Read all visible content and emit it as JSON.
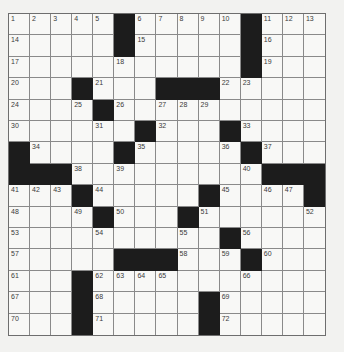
{
  "puzzle": {
    "rows": 15,
    "cols": 15,
    "colors": {
      "paper": "#f2f2f0",
      "cell": "#f8f8f6",
      "black": "#1c1c1c",
      "grid_line": "#8a8a8a",
      "number_text": "#3a3a3a"
    },
    "black_cells": [
      [
        0,
        5
      ],
      [
        0,
        11
      ],
      [
        1,
        5
      ],
      [
        1,
        11
      ],
      [
        2,
        11
      ],
      [
        3,
        3
      ],
      [
        3,
        7
      ],
      [
        3,
        8
      ],
      [
        3,
        9
      ],
      [
        4,
        4
      ],
      [
        5,
        6
      ],
      [
        5,
        10
      ],
      [
        6,
        0
      ],
      [
        6,
        5
      ],
      [
        6,
        11
      ],
      [
        7,
        0
      ],
      [
        7,
        1
      ],
      [
        7,
        2
      ],
      [
        7,
        12
      ],
      [
        7,
        13
      ],
      [
        7,
        14
      ],
      [
        8,
        3
      ],
      [
        8,
        9
      ],
      [
        8,
        14
      ],
      [
        9,
        4
      ],
      [
        9,
        8
      ],
      [
        10,
        10
      ],
      [
        11,
        5
      ],
      [
        11,
        6
      ],
      [
        11,
        7
      ],
      [
        11,
        11
      ],
      [
        12,
        3
      ],
      [
        13,
        3
      ],
      [
        13,
        9
      ],
      [
        14,
        3
      ],
      [
        14,
        9
      ]
    ],
    "numbers": [
      {
        "r": 0,
        "c": 0,
        "n": "1"
      },
      {
        "r": 0,
        "c": 1,
        "n": "2"
      },
      {
        "r": 0,
        "c": 2,
        "n": "3"
      },
      {
        "r": 0,
        "c": 3,
        "n": "4"
      },
      {
        "r": 0,
        "c": 4,
        "n": "5"
      },
      {
        "r": 0,
        "c": 6,
        "n": "6"
      },
      {
        "r": 0,
        "c": 7,
        "n": "7"
      },
      {
        "r": 0,
        "c": 8,
        "n": "8"
      },
      {
        "r": 0,
        "c": 9,
        "n": "9"
      },
      {
        "r": 0,
        "c": 10,
        "n": "10"
      },
      {
        "r": 0,
        "c": 12,
        "n": "11"
      },
      {
        "r": 0,
        "c": 13,
        "n": "12"
      },
      {
        "r": 0,
        "c": 14,
        "n": "13"
      },
      {
        "r": 1,
        "c": 0,
        "n": "14"
      },
      {
        "r": 1,
        "c": 6,
        "n": "15"
      },
      {
        "r": 1,
        "c": 12,
        "n": "16"
      },
      {
        "r": 2,
        "c": 0,
        "n": "17"
      },
      {
        "r": 2,
        "c": 5,
        "n": "18"
      },
      {
        "r": 2,
        "c": 12,
        "n": "19"
      },
      {
        "r": 3,
        "c": 0,
        "n": "20"
      },
      {
        "r": 3,
        "c": 4,
        "n": "21"
      },
      {
        "r": 3,
        "c": 10,
        "n": "22"
      },
      {
        "r": 3,
        "c": 11,
        "n": "23"
      },
      {
        "r": 4,
        "c": 0,
        "n": "24"
      },
      {
        "r": 4,
        "c": 3,
        "n": "25"
      },
      {
        "r": 4,
        "c": 5,
        "n": "26"
      },
      {
        "r": 4,
        "c": 7,
        "n": "27"
      },
      {
        "r": 4,
        "c": 8,
        "n": "28"
      },
      {
        "r": 4,
        "c": 9,
        "n": "29"
      },
      {
        "r": 5,
        "c": 0,
        "n": "30"
      },
      {
        "r": 5,
        "c": 4,
        "n": "31"
      },
      {
        "r": 5,
        "c": 7,
        "n": "32"
      },
      {
        "r": 5,
        "c": 11,
        "n": "33"
      },
      {
        "r": 6,
        "c": 1,
        "n": "34"
      },
      {
        "r": 6,
        "c": 6,
        "n": "35"
      },
      {
        "r": 6,
        "c": 10,
        "n": "36"
      },
      {
        "r": 6,
        "c": 12,
        "n": "37"
      },
      {
        "r": 7,
        "c": 3,
        "n": "38"
      },
      {
        "r": 7,
        "c": 5,
        "n": "39"
      },
      {
        "r": 7,
        "c": 11,
        "n": "40"
      },
      {
        "r": 8,
        "c": 0,
        "n": "41"
      },
      {
        "r": 8,
        "c": 1,
        "n": "42"
      },
      {
        "r": 8,
        "c": 2,
        "n": "43"
      },
      {
        "r": 8,
        "c": 4,
        "n": "44"
      },
      {
        "r": 8,
        "c": 10,
        "n": "45"
      },
      {
        "r": 8,
        "c": 12,
        "n": "46"
      },
      {
        "r": 8,
        "c": 13,
        "n": "47"
      },
      {
        "r": 9,
        "c": 0,
        "n": "48"
      },
      {
        "r": 9,
        "c": 3,
        "n": "49"
      },
      {
        "r": 9,
        "c": 5,
        "n": "50"
      },
      {
        "r": 9,
        "c": 9,
        "n": "51"
      },
      {
        "r": 9,
        "c": 14,
        "n": "52"
      },
      {
        "r": 10,
        "c": 0,
        "n": "53"
      },
      {
        "r": 10,
        "c": 4,
        "n": "54"
      },
      {
        "r": 10,
        "c": 8,
        "n": "55"
      },
      {
        "r": 10,
        "c": 11,
        "n": "56"
      },
      {
        "r": 11,
        "c": 0,
        "n": "57"
      },
      {
        "r": 11,
        "c": 8,
        "n": "58"
      },
      {
        "r": 11,
        "c": 10,
        "n": "59"
      },
      {
        "r": 11,
        "c": 12,
        "n": "60"
      },
      {
        "r": 12,
        "c": 0,
        "n": "61"
      },
      {
        "r": 12,
        "c": 4,
        "n": "62"
      },
      {
        "r": 12,
        "c": 5,
        "n": "63"
      },
      {
        "r": 12,
        "c": 6,
        "n": "64"
      },
      {
        "r": 12,
        "c": 7,
        "n": "65"
      },
      {
        "r": 12,
        "c": 11,
        "n": "66"
      },
      {
        "r": 13,
        "c": 0,
        "n": "67"
      },
      {
        "r": 13,
        "c": 4,
        "n": "68"
      },
      {
        "r": 13,
        "c": 10,
        "n": "69"
      },
      {
        "r": 14,
        "c": 0,
        "n": "70"
      },
      {
        "r": 14,
        "c": 4,
        "n": "71"
      },
      {
        "r": 14,
        "c": 10,
        "n": "72"
      }
    ]
  }
}
